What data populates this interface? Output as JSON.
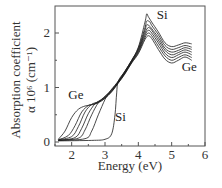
{
  "chart_data": {
    "type": "line",
    "title": "",
    "xlabel": "Energy (eV)",
    "ylabel_line1": "Absorption coefficient",
    "ylabel_line2": "α 10⁶ (cm⁻¹)",
    "xlim": [
      1.5,
      6.0
    ],
    "ylim": [
      0,
      2.5
    ],
    "xticks": [
      2,
      3,
      4,
      5,
      6
    ],
    "yticks": [
      0,
      1,
      2
    ],
    "x_minor_ticks": [
      1.5,
      2.5,
      3.5,
      4.5,
      5.5
    ],
    "y_minor_ticks": [
      0.5,
      1.5
    ],
    "grid": false,
    "annotations": [
      {
        "text": "Si",
        "x": 4.55,
        "y": 2.25
      },
      {
        "text": "Ge",
        "x": 5.3,
        "y": 1.3
      },
      {
        "text": "Ge",
        "x": 1.9,
        "y": 0.78
      },
      {
        "text": "Si",
        "x": 3.3,
        "y": 0.38
      }
    ],
    "series": [
      {
        "name": "Ge",
        "x": [
          1.6,
          1.8,
          2.0,
          2.2,
          2.4,
          2.6,
          2.8,
          3.0,
          3.2,
          3.4,
          3.6,
          3.8,
          4.0,
          4.2,
          4.3,
          4.4,
          4.6,
          4.8,
          5.0,
          5.2,
          5.4,
          5.6
        ],
        "y": [
          0.05,
          0.2,
          0.45,
          0.6,
          0.66,
          0.68,
          0.72,
          0.8,
          0.92,
          1.08,
          1.25,
          1.45,
          1.62,
          1.88,
          1.95,
          1.9,
          1.7,
          1.52,
          1.45,
          1.5,
          1.56,
          1.5
        ]
      },
      {
        "name": "Ge-Si 1",
        "x": [
          1.6,
          1.9,
          2.1,
          2.3,
          2.5,
          2.6,
          2.8,
          3.0,
          3.2,
          3.4,
          3.6,
          3.8,
          4.0,
          4.2,
          4.3,
          4.4,
          4.6,
          4.8,
          5.0,
          5.2,
          5.4,
          5.6
        ],
        "y": [
          0.04,
          0.12,
          0.3,
          0.55,
          0.67,
          0.69,
          0.73,
          0.81,
          0.93,
          1.09,
          1.26,
          1.46,
          1.64,
          1.92,
          2.0,
          1.95,
          1.76,
          1.58,
          1.5,
          1.55,
          1.6,
          1.55
        ]
      },
      {
        "name": "Ge-Si 2",
        "x": [
          1.6,
          2.0,
          2.2,
          2.4,
          2.6,
          2.8,
          3.0,
          3.2,
          3.4,
          3.6,
          3.8,
          4.0,
          4.2,
          4.3,
          4.4,
          4.6,
          4.8,
          5.0,
          5.2,
          5.4,
          5.6
        ],
        "y": [
          0.04,
          0.1,
          0.28,
          0.55,
          0.69,
          0.74,
          0.82,
          0.94,
          1.1,
          1.27,
          1.47,
          1.66,
          1.96,
          2.05,
          2.0,
          1.82,
          1.63,
          1.55,
          1.6,
          1.65,
          1.6
        ]
      },
      {
        "name": "Ge-Si 3",
        "x": [
          1.6,
          2.1,
          2.3,
          2.5,
          2.7,
          2.9,
          3.0,
          3.2,
          3.4,
          3.6,
          3.8,
          4.0,
          4.2,
          4.3,
          4.4,
          4.6,
          4.8,
          5.0,
          5.2,
          5.4,
          5.6
        ],
        "y": [
          0.03,
          0.08,
          0.25,
          0.52,
          0.7,
          0.78,
          0.83,
          0.95,
          1.1,
          1.28,
          1.48,
          1.68,
          2.0,
          2.1,
          2.05,
          1.87,
          1.68,
          1.6,
          1.64,
          1.69,
          1.65
        ]
      },
      {
        "name": "Ge-Si 4",
        "x": [
          1.6,
          2.2,
          2.4,
          2.6,
          2.8,
          3.0,
          3.2,
          3.4,
          3.6,
          3.8,
          4.0,
          4.2,
          4.25,
          4.35,
          4.4,
          4.6,
          4.8,
          5.0,
          5.2,
          5.4,
          5.6
        ],
        "y": [
          0.03,
          0.07,
          0.22,
          0.5,
          0.72,
          0.84,
          0.96,
          1.11,
          1.29,
          1.49,
          1.7,
          2.05,
          2.15,
          2.12,
          2.08,
          1.92,
          1.72,
          1.65,
          1.68,
          1.73,
          1.7
        ]
      },
      {
        "name": "Ge-Si 5",
        "x": [
          1.6,
          2.4,
          2.6,
          2.8,
          3.0,
          3.1,
          3.2,
          3.4,
          3.6,
          3.8,
          4.0,
          4.2,
          4.25,
          4.35,
          4.4,
          4.6,
          4.8,
          5.0,
          5.2,
          5.4,
          5.6
        ],
        "y": [
          0.03,
          0.06,
          0.2,
          0.5,
          0.78,
          0.88,
          0.97,
          1.12,
          1.3,
          1.5,
          1.72,
          2.1,
          2.22,
          2.2,
          2.14,
          1.97,
          1.77,
          1.7,
          1.73,
          1.77,
          1.74
        ]
      },
      {
        "name": "Si",
        "x": [
          1.6,
          2.6,
          3.0,
          3.2,
          3.3,
          3.35,
          3.4,
          3.6,
          3.8,
          4.0,
          4.2,
          4.25,
          4.3,
          4.4,
          4.6,
          4.8,
          5.0,
          5.2,
          5.4,
          5.6
        ],
        "y": [
          0.02,
          0.03,
          0.05,
          0.15,
          0.5,
          0.9,
          1.12,
          1.3,
          1.5,
          1.74,
          2.2,
          2.35,
          2.3,
          2.2,
          2.02,
          1.82,
          1.75,
          1.78,
          1.82,
          1.8
        ]
      }
    ]
  }
}
